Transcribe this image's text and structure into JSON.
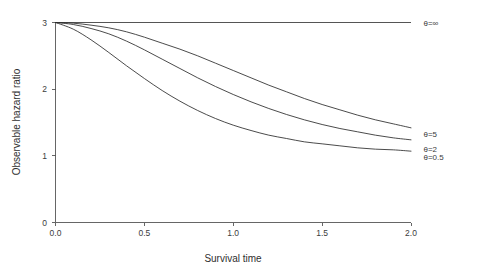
{
  "chart_data": {
    "type": "line",
    "title": "",
    "xlabel": "Survival time",
    "ylabel": "Observable hazard ratio",
    "xlim": [
      0.0,
      2.0
    ],
    "ylim": [
      0,
      3
    ],
    "xticks": [
      "0.0",
      "0.5",
      "1.0",
      "1.5",
      "2.0"
    ],
    "xtick_values": [
      0.0,
      0.5,
      1.0,
      1.5,
      2.0
    ],
    "yticks": [
      "0",
      "1",
      "2",
      "3"
    ],
    "ytick_values": [
      0,
      1,
      2,
      3
    ],
    "grid": false,
    "legend_position": "right-of-curve-ends",
    "x": [
      0.0,
      0.1,
      0.2,
      0.3,
      0.4,
      0.5,
      0.6,
      0.7,
      0.8,
      0.9,
      1.0,
      1.1,
      1.2,
      1.3,
      1.4,
      1.5,
      1.6,
      1.7,
      1.8,
      1.9,
      2.0
    ],
    "series": [
      {
        "name": "theta-infinity",
        "label": "θ=∞",
        "values": [
          3.0,
          3.0,
          3.0,
          3.0,
          3.0,
          3.0,
          3.0,
          3.0,
          3.0,
          3.0,
          3.0,
          3.0,
          3.0,
          3.0,
          3.0,
          3.0,
          3.0,
          3.0,
          3.0,
          3.0,
          3.0
        ],
        "label_x": 2.07,
        "label_y": 3.0
      },
      {
        "name": "theta-5",
        "label": "θ=5",
        "values": [
          3.0,
          2.99,
          2.96,
          2.92,
          2.86,
          2.78,
          2.69,
          2.6,
          2.5,
          2.39,
          2.28,
          2.17,
          2.06,
          1.96,
          1.86,
          1.77,
          1.69,
          1.61,
          1.54,
          1.48,
          1.42
        ],
        "label_x": 2.07,
        "label_y": 1.33
      },
      {
        "name": "theta-2",
        "label": "θ=2",
        "values": [
          3.0,
          2.97,
          2.91,
          2.83,
          2.72,
          2.59,
          2.45,
          2.31,
          2.17,
          2.04,
          1.92,
          1.81,
          1.71,
          1.62,
          1.54,
          1.47,
          1.41,
          1.36,
          1.31,
          1.27,
          1.24
        ],
        "label_x": 2.07,
        "label_y": 1.11
      },
      {
        "name": "theta-0.5",
        "label": "θ=0.5",
        "values": [
          3.0,
          2.9,
          2.74,
          2.55,
          2.35,
          2.16,
          1.98,
          1.82,
          1.68,
          1.56,
          1.46,
          1.38,
          1.31,
          1.26,
          1.21,
          1.18,
          1.15,
          1.12,
          1.1,
          1.09,
          1.07
        ],
        "label_x": 2.07,
        "label_y": 0.99
      }
    ]
  },
  "axes": {
    "x_title": "Survival time",
    "y_title": "Observable hazard ratio"
  },
  "tick_text": {
    "x": [
      "0.0",
      "0.5",
      "1.0",
      "1.5",
      "2.0"
    ],
    "y": [
      "0",
      "1",
      "2",
      "3"
    ]
  },
  "series_labels": {
    "inf": "θ=∞",
    "five": "θ=5",
    "two": "θ=2",
    "half": "θ=0.5"
  },
  "colors": {
    "curve": "#2b2b2b",
    "axis": "#555555",
    "text": "#3a3a3a",
    "background": "#ffffff"
  }
}
